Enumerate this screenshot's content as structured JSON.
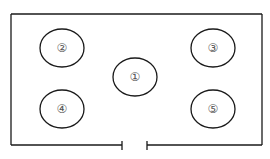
{
  "diagram": {
    "type": "floor-plan",
    "colors": {
      "stroke": "#1a1a1a",
      "label": "#555555",
      "background": "#ffffff"
    },
    "room": {
      "x": 11,
      "y": 14,
      "width": 251,
      "height": 131
    },
    "door": {
      "left_x": 122,
      "right_x": 147,
      "y": 145
    },
    "positions": [
      {
        "id": "1",
        "label": "①",
        "cx": 135,
        "cy": 77,
        "rx": 22,
        "ry": 19
      },
      {
        "id": "2",
        "label": "②",
        "cx": 62,
        "cy": 48,
        "rx": 22,
        "ry": 19
      },
      {
        "id": "3",
        "label": "③",
        "cx": 213,
        "cy": 48,
        "rx": 22,
        "ry": 19
      },
      {
        "id": "4",
        "label": "④",
        "cx": 62,
        "cy": 109,
        "rx": 22,
        "ry": 19
      },
      {
        "id": "5",
        "label": "⑤",
        "cx": 213,
        "cy": 109,
        "rx": 22,
        "ry": 19
      }
    ]
  }
}
